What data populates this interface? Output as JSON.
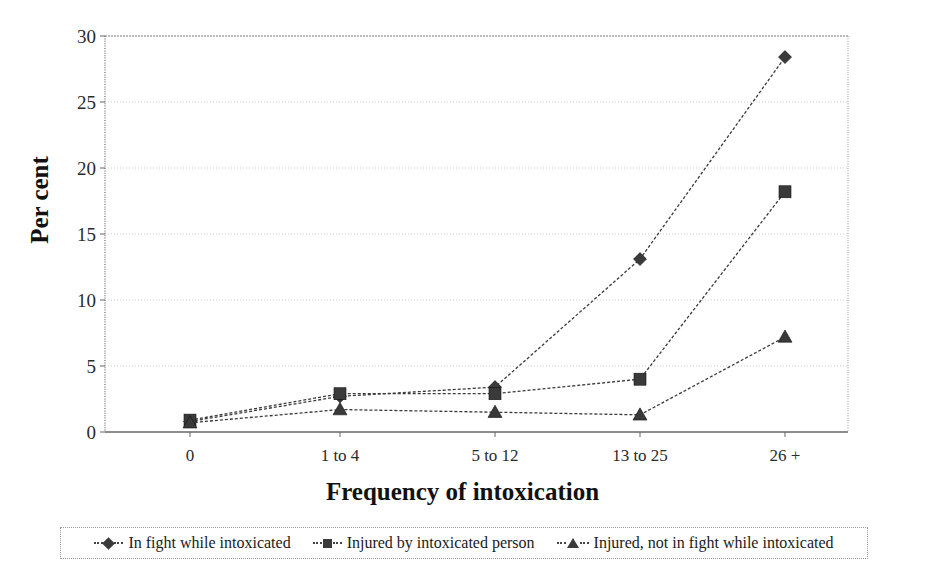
{
  "chart_data": {
    "type": "line",
    "title": "",
    "xlabel": "Frequency of intoxication",
    "ylabel": "Per cent",
    "categories": [
      "0",
      "1 to 4",
      "5 to 12",
      "13 to 25",
      "26 +"
    ],
    "ylim": [
      0,
      30
    ],
    "yticks": [
      0,
      5,
      10,
      15,
      20,
      25,
      30
    ],
    "grid": true,
    "legend_position": "bottom",
    "series": [
      {
        "name": "In fight while intoxicated",
        "marker": "diamond",
        "color": "#3a3a3a",
        "values": [
          0.8,
          2.7,
          3.4,
          13.1,
          28.4
        ]
      },
      {
        "name": "Injured by intoxicated person",
        "marker": "square",
        "color": "#3a3a3a",
        "values": [
          0.9,
          2.9,
          2.9,
          4.0,
          18.2
        ]
      },
      {
        "name": "Injured, not in fight while intoxicated",
        "marker": "triangle",
        "color": "#3a3a3a",
        "values": [
          0.7,
          1.7,
          1.5,
          1.3,
          7.2
        ]
      }
    ]
  },
  "axis": {
    "ylabel_text": "Per cent",
    "xlabel_text": "Frequency of intoxication",
    "ytick_labels": [
      "30",
      "25",
      "20",
      "15",
      "10",
      "5",
      "0"
    ],
    "xtick_labels": [
      "0",
      "1 to 4",
      "5 to 12",
      "13 to 25",
      "26 +"
    ]
  },
  "legend": {
    "items": [
      {
        "label": "In fight while intoxicated",
        "marker": "diamond-icon"
      },
      {
        "label": "Injured by intoxicated person",
        "marker": "square-icon"
      },
      {
        "label": "Injured, not in fight while intoxicated",
        "marker": "triangle-icon"
      }
    ]
  },
  "colors": {
    "series": "#3a3a3a",
    "grid": "#cfcfcf",
    "axis": "#555555",
    "text": "#1a1a1a"
  }
}
